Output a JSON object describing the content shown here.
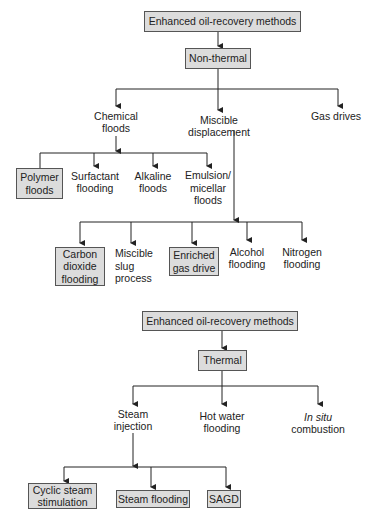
{
  "diagram_top": {
    "title": "Enhanced oil-recovery methods",
    "category": "Non-thermal",
    "branches": [
      {
        "label": "Chemical\nfloods"
      },
      {
        "label": "Miscible\ndisplacement"
      },
      {
        "label": "Gas drives"
      }
    ],
    "chemical_children": [
      {
        "label": "Polymer\nfloods",
        "highlighted": true
      },
      {
        "label": "Surfactant\nflooding",
        "highlighted": false
      },
      {
        "label": "Alkaline\nfloods",
        "highlighted": false
      },
      {
        "label": "Emulsion/\nmicellar\nfloods",
        "highlighted": false
      }
    ],
    "miscible_children": [
      {
        "label": "Carbon\ndioxide\nflooding",
        "highlighted": true
      },
      {
        "label": "Miscible\nslug\nprocess",
        "highlighted": false
      },
      {
        "label": "Enriched\ngas drive",
        "highlighted": true
      },
      {
        "label": "Alcohol\nflooding",
        "highlighted": false
      },
      {
        "label": "Nitrogen\nflooding",
        "highlighted": false
      }
    ]
  },
  "diagram_bottom": {
    "title": "Enhanced oil-recovery methods",
    "category": "Thermal",
    "branches": [
      {
        "label": "Steam\ninjection"
      },
      {
        "label": "Hot water\nflooding"
      },
      {
        "label_italic": "In situ",
        "label": "combustion"
      }
    ],
    "steam_children": [
      {
        "label": "Cyclic steam\nstimulation",
        "highlighted": true
      },
      {
        "label": "Steam flooding",
        "highlighted": true
      },
      {
        "label": "SAGD",
        "highlighted": true
      }
    ]
  },
  "colors": {
    "box_fill": "#dcdcdc",
    "box_border": "#555555",
    "line": "#222222"
  }
}
